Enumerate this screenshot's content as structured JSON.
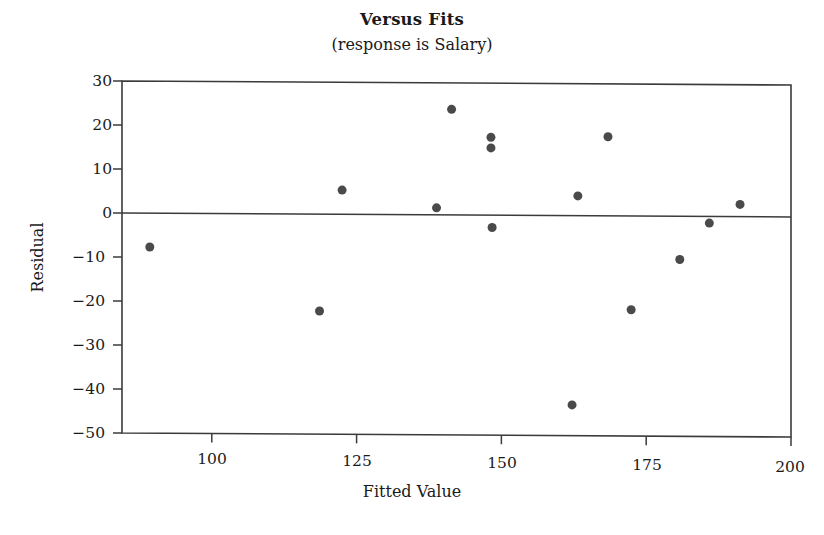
{
  "chart_data": {
    "type": "scatter",
    "title": "Versus Fits",
    "subtitle": "(response is Salary)",
    "xlabel": "Fitted Value",
    "ylabel": "Residual",
    "xlim": [
      84.5,
      200
    ],
    "ylim": [
      -50,
      30
    ],
    "xticks": [
      100,
      125,
      150,
      175,
      200
    ],
    "yticks": [
      30,
      20,
      10,
      0,
      -10,
      -20,
      -30,
      -40,
      -50
    ],
    "xtick_labels": [
      "100",
      "125",
      "150",
      "175",
      "200"
    ],
    "ytick_labels": [
      "30",
      "20",
      "10",
      "0",
      "−10",
      "−20",
      "−30",
      "−40",
      "−50"
    ],
    "grid": false,
    "legend": false,
    "reference_line": {
      "y": 0,
      "label": "zero-residual-line"
    },
    "marker_color": "#4a4a4a",
    "marker_size": 9,
    "frame_color": "#3b3b3b",
    "points": [
      {
        "x": 89.3,
        "y": -7.7
      },
      {
        "x": 118.6,
        "y": -22.0
      },
      {
        "x": 122.5,
        "y": 5.5
      },
      {
        "x": 138.8,
        "y": 1.6
      },
      {
        "x": 141.4,
        "y": 24.0
      },
      {
        "x": 148.2,
        "y": 17.7
      },
      {
        "x": 148.2,
        "y": 15.3
      },
      {
        "x": 148.4,
        "y": -2.8
      },
      {
        "x": 162.2,
        "y": -43.0
      },
      {
        "x": 163.2,
        "y": 4.5
      },
      {
        "x": 168.4,
        "y": 18.0
      },
      {
        "x": 172.4,
        "y": -21.3
      },
      {
        "x": 180.8,
        "y": -9.8
      },
      {
        "x": 185.9,
        "y": -1.5
      },
      {
        "x": 191.2,
        "y": 2.8
      }
    ]
  }
}
